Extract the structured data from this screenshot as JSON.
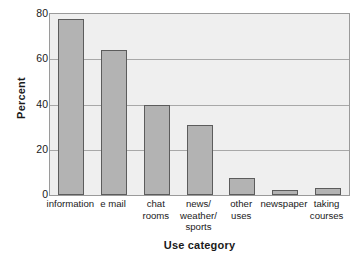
{
  "chart_data": {
    "type": "bar",
    "title": "",
    "xlabel": "Use category",
    "ylabel": "Percent",
    "categories": [
      "information",
      "e mail",
      "chat rooms",
      "news/ weather/ sports",
      "other uses",
      "newspaper",
      "taking courses"
    ],
    "category_lines": [
      [
        "information"
      ],
      [
        "e mail"
      ],
      [
        "chat",
        "rooms"
      ],
      [
        "news/",
        "weather/",
        "sports"
      ],
      [
        "other",
        "uses"
      ],
      [
        "newspaper"
      ],
      [
        "taking",
        "courses"
      ]
    ],
    "values": [
      78,
      64,
      40,
      31,
      7.5,
      2,
      3
    ],
    "ylim": [
      0,
      80
    ],
    "yticks": [
      0,
      20,
      40,
      60,
      80
    ],
    "ytick_labels": [
      "0",
      "20",
      "40",
      "60",
      "80"
    ],
    "grid": true,
    "grid_axis": "y",
    "legend": false,
    "bar_color": "#b3b3b3",
    "bar_edge_color": "#5c5c5c",
    "plot_background": "#efefef",
    "grid_color": "#a8a8a8",
    "frame_color": "#9a9a9a",
    "figure_background": "#ffffff"
  }
}
